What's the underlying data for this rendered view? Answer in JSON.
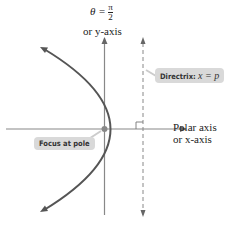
{
  "diagram": {
    "type": "polar conic - parabola",
    "y_axis_label": {
      "line1_prefix": "θ = ",
      "fraction_num": "π",
      "fraction_den": "2",
      "line2": "or y-axis"
    },
    "x_axis_label": {
      "line1": "Polar axis",
      "line2": "or x-axis"
    },
    "directrix_label": {
      "bold": "Directrix:",
      "math": "x = p"
    },
    "focus_label": "Focus at pole",
    "colors": {
      "curve": "#555555",
      "axis": "#777777",
      "tag_bg": "#d9d9d9",
      "focus_dot": "#777777"
    }
  }
}
